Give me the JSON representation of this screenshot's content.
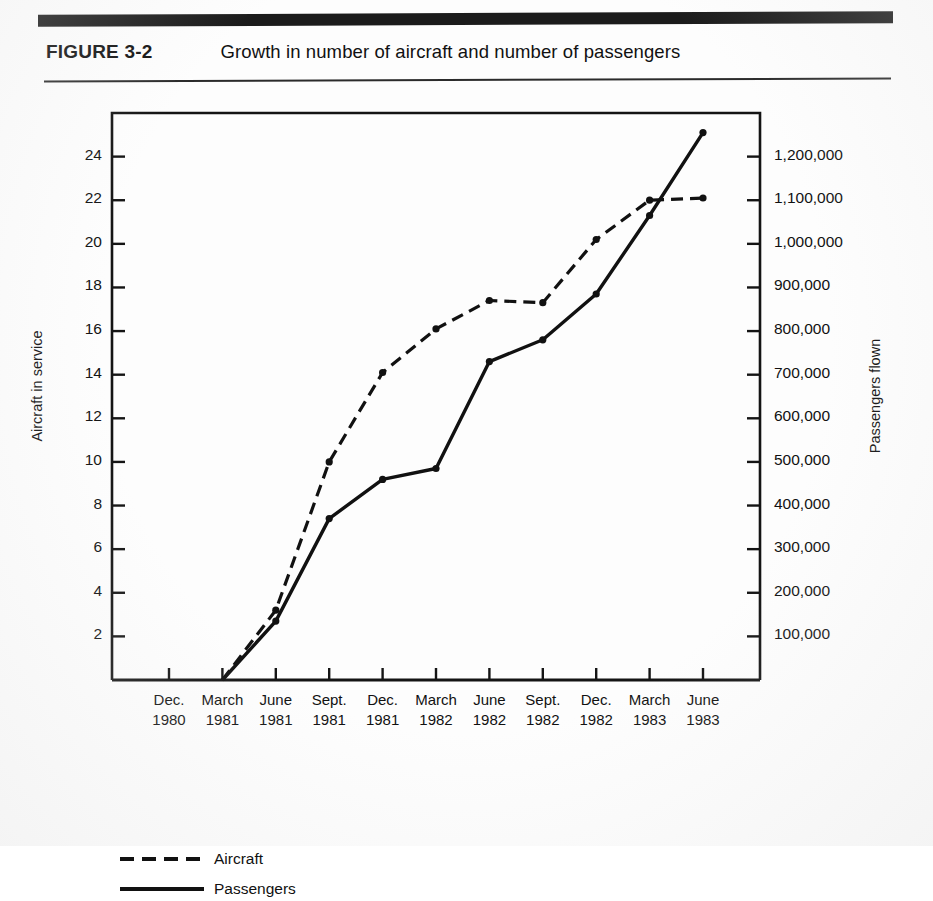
{
  "header": {
    "figure_label": "FIGURE 3-2",
    "title": "Growth in number of aircraft and number of passengers"
  },
  "legend": {
    "position": "below-axis-left",
    "items": [
      {
        "label": "Aircraft",
        "style": "dashed",
        "color": "#111111"
      },
      {
        "label": "Passengers",
        "style": "solid",
        "color": "#111111"
      }
    ]
  },
  "chart_data": {
    "type": "line",
    "title": "Growth in number of aircraft and number of passengers",
    "xlabel": "",
    "ylabel": "Aircraft in service",
    "y2label": "Passengers flown",
    "grid": false,
    "legend_position": "bottom-left",
    "categories": [
      "Dec. 1980",
      "March 1981",
      "June 1981",
      "Sept. 1981",
      "Dec. 1981",
      "March 1982",
      "June 1982",
      "Sept. 1982",
      "Dec. 1982",
      "March 1983",
      "June 1983"
    ],
    "x_tick_labels": [
      {
        "month": "Dec.",
        "year": "1980"
      },
      {
        "month": "March",
        "year": "1981"
      },
      {
        "month": "June",
        "year": "1981"
      },
      {
        "month": "Sept.",
        "year": "1981"
      },
      {
        "month": "Dec.",
        "year": "1981"
      },
      {
        "month": "March",
        "year": "1982"
      },
      {
        "month": "June",
        "year": "1982"
      },
      {
        "month": "Sept.",
        "year": "1982"
      },
      {
        "month": "Dec.",
        "year": "1982"
      },
      {
        "month": "March",
        "year": "1983"
      },
      {
        "month": "June",
        "year": "1983"
      }
    ],
    "ylim": [
      0,
      26
    ],
    "y_ticks": [
      2,
      4,
      6,
      8,
      10,
      12,
      14,
      16,
      18,
      20,
      22,
      24
    ],
    "y_tick_labels": [
      "2",
      "4",
      "6",
      "8",
      "10",
      "12",
      "14",
      "16",
      "18",
      "20",
      "22",
      "24"
    ],
    "y2lim": [
      0,
      1300000
    ],
    "y2_ticks": [
      100000,
      200000,
      300000,
      400000,
      500000,
      600000,
      700000,
      800000,
      900000,
      1000000,
      1100000,
      1200000
    ],
    "y2_tick_labels": [
      "100,000",
      "200,000",
      "300,000",
      "400,000",
      "500,000",
      "600,000",
      "700,000",
      "800,000",
      "900,000",
      "1,000,000",
      "1,100,000",
      "1,200,000"
    ],
    "series": [
      {
        "name": "Aircraft",
        "axis": "left",
        "style": "dashed",
        "units": "aircraft in service",
        "values": [
          null,
          0,
          3.2,
          10.0,
          14.1,
          16.1,
          17.4,
          17.3,
          20.2,
          22.0,
          22.1
        ]
      },
      {
        "name": "Passengers",
        "axis": "right",
        "style": "solid",
        "units": "passengers flown",
        "values": [
          null,
          0,
          135000,
          370000,
          460000,
          485000,
          730000,
          780000,
          885000,
          1065000,
          1255000
        ]
      }
    ]
  }
}
